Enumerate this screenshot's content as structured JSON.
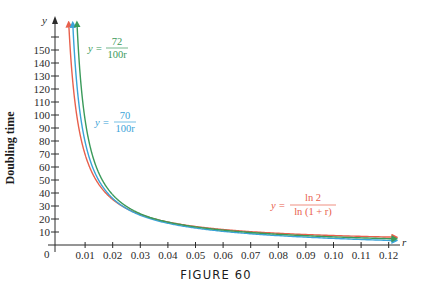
{
  "chart_data": {
    "type": "line",
    "title": "",
    "caption": "FIGURE 60",
    "xlabel": "r",
    "ylabel": "Doubling time",
    "y_axis_symbol": "y",
    "origin_label": "0",
    "xlim": [
      0,
      0.125
    ],
    "ylim": [
      0,
      165
    ],
    "grid": false,
    "x_ticks": [
      "0.01",
      "0.02",
      "0.03",
      "0.04",
      "0.05",
      "0.06",
      "0.07",
      "0.08",
      "0.09",
      "0.10",
      "0.11",
      "0.12"
    ],
    "x_tick_values": [
      0.01,
      0.02,
      0.03,
      0.04,
      0.05,
      0.06,
      0.07,
      0.08,
      0.09,
      0.1,
      0.11,
      0.12
    ],
    "y_ticks": [
      "10",
      "20",
      "30",
      "40",
      "50",
      "60",
      "70",
      "80",
      "90",
      "100",
      "110",
      "120",
      "130",
      "140",
      "150"
    ],
    "y_tick_values": [
      10,
      20,
      30,
      40,
      50,
      60,
      70,
      80,
      90,
      100,
      110,
      120,
      130,
      140,
      150,
      160
    ],
    "series": [
      {
        "name": "y = ln 2 / ln(1 + r)",
        "formula": "ln2/ln(1+r)",
        "color": "#e8604c",
        "label_numerator": "ln 2",
        "label_denominator": "ln (1 + r)",
        "x": [
          0.005,
          0.01,
          0.02,
          0.03,
          0.04,
          0.05,
          0.06,
          0.07,
          0.08,
          0.09,
          0.1,
          0.11,
          0.12
        ],
        "values": [
          139.0,
          69.7,
          35.0,
          23.4,
          17.7,
          14.2,
          11.9,
          10.2,
          9.0,
          8.0,
          7.3,
          6.6,
          6.1
        ]
      },
      {
        "name": "y = 70 / 100r",
        "formula": "0.70/r",
        "color": "#3aa3d8",
        "label_numerator": "70",
        "label_denominator": "100r",
        "x": [
          0.005,
          0.01,
          0.02,
          0.03,
          0.04,
          0.05,
          0.06,
          0.07,
          0.08,
          0.09,
          0.1,
          0.11,
          0.12
        ],
        "values": [
          140.0,
          70.0,
          35.0,
          23.3,
          17.5,
          14.0,
          11.7,
          10.0,
          8.75,
          7.8,
          7.0,
          6.4,
          5.8
        ]
      },
      {
        "name": "y = 72 / 100r",
        "formula": "0.72/r",
        "color": "#3a9a5a",
        "label_numerator": "72",
        "label_denominator": "100r",
        "x": [
          0.005,
          0.01,
          0.02,
          0.03,
          0.04,
          0.05,
          0.06,
          0.07,
          0.08,
          0.09,
          0.1,
          0.11,
          0.12
        ],
        "values": [
          144.0,
          72.0,
          36.0,
          24.0,
          18.0,
          14.4,
          12.0,
          10.3,
          9.0,
          8.0,
          7.2,
          6.5,
          6.0
        ]
      }
    ]
  }
}
